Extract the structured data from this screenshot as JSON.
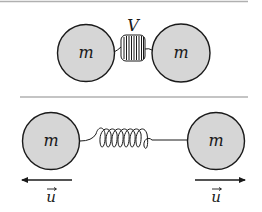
{
  "diagram": {
    "colors": {
      "mass_fill": "#d6d6d6",
      "stroke": "#1a1a1a",
      "divider": "#b0b0b0",
      "background": "#ffffff"
    },
    "top_panel": {
      "left_mass_label": "m",
      "right_mass_label": "m",
      "spring_label": "V",
      "spring_state": "compressed"
    },
    "bottom_panel": {
      "left_mass_label": "m",
      "right_mass_label": "m",
      "spring_state": "relaxed",
      "left_velocity_label": "u",
      "right_velocity_label": "u",
      "left_velocity_direction": "left",
      "right_velocity_direction": "right"
    }
  }
}
